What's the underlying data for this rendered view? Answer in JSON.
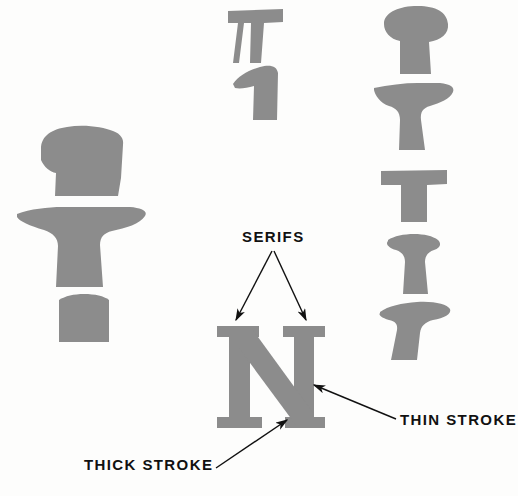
{
  "figure": {
    "background_color": "#fdfdfc",
    "shape_color": "#8c8c8c",
    "label_color": "#111111",
    "arrow_color": "#111111"
  },
  "labels": {
    "serifs": "SERIFS",
    "thin_stroke": "THIN  STROKE",
    "thick_stroke": "THICK  STROKE"
  },
  "letter": {
    "glyph": "N",
    "description": "Large serif capital N with thin vertical stems and thick diagonal stroke"
  },
  "serif_specimens": [
    {
      "name": "left-column-specimen-1",
      "description": "Bracketed slab serif, heavy top, angled"
    },
    {
      "name": "left-column-specimen-2",
      "description": "Wide winged serif on vertical stem"
    },
    {
      "name": "left-column-specimen-3",
      "description": "Square slab serif on short stem"
    },
    {
      "name": "middle-column-specimen-1",
      "description": "Flat slab serif with split hairline stem"
    },
    {
      "name": "middle-column-specimen-2",
      "description": "One-sided flag serif"
    },
    {
      "name": "right-column-specimen-1",
      "description": "Rounded ball-top serif on tapered stem"
    },
    {
      "name": "right-column-specimen-2",
      "description": "Winged bracketed serif on flaring stem"
    },
    {
      "name": "right-column-specimen-3",
      "description": "Square slab serif, heavy rectangular"
    },
    {
      "name": "right-column-specimen-4",
      "description": "Cupped serif on flaring stem"
    },
    {
      "name": "right-column-specimen-5",
      "description": "Wide flat serif on angled stem"
    }
  ],
  "callouts": [
    {
      "name": "serifs-callout-left",
      "from": "SERIFS label",
      "to": "left top serif of N"
    },
    {
      "name": "serifs-callout-right",
      "from": "SERIFS label",
      "to": "right top serif of N"
    },
    {
      "name": "thin-stroke-callout",
      "from": "THIN STROKE label",
      "to": "right vertical stem of N"
    },
    {
      "name": "thick-stroke-callout",
      "from": "THICK STROKE label",
      "to": "diagonal stroke of N"
    }
  ]
}
